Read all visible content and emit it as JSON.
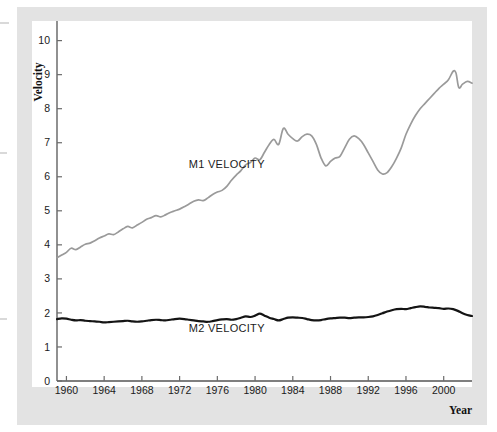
{
  "figure": {
    "background_color": "#ffffff",
    "plate_color": "#e3e3e3",
    "canvas_color": "#ffffff"
  },
  "chart_data": {
    "type": "line",
    "title": "",
    "subtitle": "",
    "xlabel": "Year",
    "ylabel": "Velocity",
    "xlim": [
      1959.0,
      2003.0
    ],
    "ylim": [
      0,
      10.4
    ],
    "xticks": [
      1960,
      1964,
      1968,
      1972,
      1976,
      1980,
      1984,
      1988,
      1992,
      1996,
      2000
    ],
    "xtick_labels": [
      "1960",
      "1964",
      "1968",
      "1972",
      "1976",
      "1980",
      "1984",
      "1988",
      "1992",
      "1996",
      "2000"
    ],
    "yticks": [
      0,
      1,
      2,
      3,
      4,
      5,
      6,
      7,
      8,
      9,
      10
    ],
    "ytick_labels": [
      "0",
      "1",
      "2",
      "3",
      "4",
      "5",
      "6",
      "7",
      "8",
      "9",
      "10"
    ],
    "grid": false,
    "legend": "inline-annotation",
    "annotations": [
      {
        "text": "M1 VELOCITY",
        "x": 1977.0,
        "y": 6.25,
        "series": "M1 Velocity"
      },
      {
        "text": "M2 VELOCITY",
        "x": 1977.0,
        "y": 1.45,
        "series": "M2 Velocity"
      }
    ],
    "series": [
      {
        "name": "M1 Velocity",
        "color": "#9a9a9a",
        "line_width": 1.7,
        "x": [
          1959.0,
          1959.5,
          1960.0,
          1960.5,
          1961.0,
          1961.5,
          1962.0,
          1962.5,
          1963.0,
          1963.5,
          1964.0,
          1964.5,
          1965.0,
          1965.5,
          1966.0,
          1966.5,
          1967.0,
          1967.5,
          1968.0,
          1968.5,
          1969.0,
          1969.5,
          1970.0,
          1970.5,
          1971.0,
          1971.5,
          1972.0,
          1972.5,
          1973.0,
          1973.5,
          1974.0,
          1974.5,
          1975.0,
          1975.5,
          1976.0,
          1976.5,
          1977.0,
          1977.5,
          1978.0,
          1978.5,
          1979.0,
          1979.5,
          1980.0,
          1980.5,
          1981.0,
          1981.5,
          1982.0,
          1982.5,
          1983.0,
          1983.5,
          1984.0,
          1984.5,
          1985.0,
          1985.5,
          1986.0,
          1986.5,
          1987.0,
          1987.5,
          1988.0,
          1988.5,
          1989.0,
          1989.5,
          1990.0,
          1990.5,
          1991.0,
          1991.5,
          1992.0,
          1992.5,
          1993.0,
          1993.5,
          1994.0,
          1994.5,
          1995.0,
          1995.5,
          1996.0,
          1996.5,
          1997.0,
          1997.5,
          1998.0,
          1998.5,
          1999.0,
          1999.5,
          2000.0,
          2000.5,
          2001.0,
          2001.3,
          2001.6,
          2002.0,
          2002.5,
          2003.0
        ],
        "y": [
          3.62,
          3.7,
          3.78,
          3.9,
          3.86,
          3.94,
          4.02,
          4.05,
          4.12,
          4.2,
          4.26,
          4.32,
          4.3,
          4.38,
          4.47,
          4.54,
          4.5,
          4.58,
          4.66,
          4.75,
          4.8,
          4.86,
          4.82,
          4.88,
          4.95,
          5.0,
          5.05,
          5.12,
          5.2,
          5.28,
          5.32,
          5.3,
          5.38,
          5.48,
          5.55,
          5.6,
          5.72,
          5.9,
          6.05,
          6.18,
          6.35,
          6.42,
          6.55,
          6.5,
          6.72,
          6.95,
          7.1,
          6.95,
          7.42,
          7.25,
          7.12,
          7.05,
          7.18,
          7.25,
          7.2,
          6.95,
          6.55,
          6.32,
          6.45,
          6.55,
          6.6,
          6.85,
          7.1,
          7.2,
          7.12,
          6.95,
          6.7,
          6.45,
          6.2,
          6.08,
          6.12,
          6.3,
          6.55,
          6.85,
          7.25,
          7.55,
          7.8,
          8.0,
          8.15,
          8.3,
          8.45,
          8.6,
          8.72,
          8.85,
          9.1,
          9.05,
          8.62,
          8.72,
          8.8,
          8.75
        ]
      },
      {
        "name": "M2 Velocity",
        "color": "#141414",
        "line_width": 2.2,
        "x": [
          1959.0,
          1959.5,
          1960.0,
          1960.5,
          1961.0,
          1961.5,
          1962.0,
          1962.5,
          1963.0,
          1963.5,
          1964.0,
          1964.5,
          1965.0,
          1965.5,
          1966.0,
          1966.5,
          1967.0,
          1967.5,
          1968.0,
          1968.5,
          1969.0,
          1969.5,
          1970.0,
          1970.5,
          1971.0,
          1971.5,
          1972.0,
          1972.5,
          1973.0,
          1973.5,
          1974.0,
          1974.5,
          1975.0,
          1975.5,
          1976.0,
          1976.5,
          1977.0,
          1977.5,
          1978.0,
          1978.5,
          1979.0,
          1979.5,
          1980.0,
          1980.5,
          1981.0,
          1981.5,
          1982.0,
          1982.5,
          1983.0,
          1983.5,
          1984.0,
          1984.5,
          1985.0,
          1985.5,
          1986.0,
          1986.5,
          1987.0,
          1987.5,
          1988.0,
          1988.5,
          1989.0,
          1989.5,
          1990.0,
          1990.5,
          1991.0,
          1991.5,
          1992.0,
          1992.5,
          1993.0,
          1993.5,
          1994.0,
          1994.5,
          1995.0,
          1995.5,
          1996.0,
          1996.5,
          1997.0,
          1997.5,
          1998.0,
          1998.5,
          1999.0,
          1999.5,
          2000.0,
          2000.5,
          2001.0,
          2001.5,
          2002.0,
          2002.5,
          2003.0
        ],
        "y": [
          1.82,
          1.84,
          1.83,
          1.8,
          1.78,
          1.79,
          1.77,
          1.76,
          1.75,
          1.74,
          1.72,
          1.73,
          1.74,
          1.75,
          1.76,
          1.77,
          1.75,
          1.74,
          1.75,
          1.77,
          1.79,
          1.8,
          1.79,
          1.78,
          1.8,
          1.82,
          1.83,
          1.82,
          1.8,
          1.78,
          1.76,
          1.75,
          1.74,
          1.76,
          1.79,
          1.81,
          1.82,
          1.8,
          1.82,
          1.86,
          1.9,
          1.88,
          1.92,
          1.98,
          1.92,
          1.86,
          1.82,
          1.78,
          1.82,
          1.86,
          1.87,
          1.86,
          1.85,
          1.82,
          1.79,
          1.78,
          1.79,
          1.82,
          1.84,
          1.85,
          1.86,
          1.86,
          1.85,
          1.86,
          1.87,
          1.87,
          1.88,
          1.9,
          1.94,
          1.99,
          2.04,
          2.08,
          2.11,
          2.12,
          2.11,
          2.14,
          2.17,
          2.19,
          2.18,
          2.16,
          2.15,
          2.14,
          2.12,
          2.13,
          2.11,
          2.06,
          1.99,
          1.94,
          1.91
        ]
      }
    ]
  },
  "axes": {
    "y_axis_title": "Velocity",
    "x_axis_title": "Year",
    "axis_line_color": "#555555",
    "tick_color": "#6b6b6b"
  }
}
